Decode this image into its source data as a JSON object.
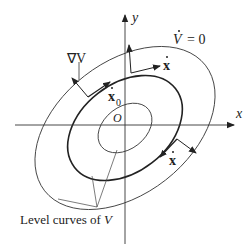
{
  "diagram": {
    "axes": {
      "x_label": "x",
      "y_label": "y",
      "origin_label": "O"
    },
    "labels": {
      "grad_v": "∇V",
      "v_dot_zero": "V̇ = 0",
      "v_dot_sym": "V",
      "v_dot_eq": "= 0",
      "x_dot_top": "x",
      "x_dot_zero": "x",
      "x_dot_zero_sub": "0",
      "x_dot_bottom": "x",
      "level_curves": "Level curves of ",
      "level_curves_var": "V"
    },
    "colors": {
      "stroke": "#333333",
      "text": "#222222",
      "background": "#ffffff"
    },
    "level_curves": [
      {
        "name": "inner",
        "rx": 30,
        "ry": 21
      },
      {
        "name": "middle",
        "rx": 64,
        "ry": 44
      },
      {
        "name": "outer",
        "rx": 102,
        "ry": 66
      }
    ]
  }
}
